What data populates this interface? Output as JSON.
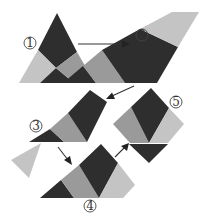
{
  "diagram": {
    "colors": {
      "dark": "#2e2e2e",
      "mid": "#9a9a9a",
      "light": "#c4c4c4",
      "background": "#ffffff"
    },
    "steps": [
      {
        "id": 1,
        "label": "①",
        "description": "Equilateral triangle divided into pieces"
      },
      {
        "id": 2,
        "label": "②",
        "description": "Pieces rearranged into slanted strip"
      },
      {
        "id": 3,
        "label": "③",
        "description": "Strip cut and shifted"
      },
      {
        "id": 4,
        "label": "④",
        "description": "Pieces rotated into trapezoid"
      },
      {
        "id": 5,
        "label": "⑤",
        "description": "Pieces form a square"
      }
    ],
    "arrows": [
      {
        "from": 1,
        "to": 2
      },
      {
        "from": 2,
        "to": 3
      },
      {
        "from": 3,
        "to": 4
      },
      {
        "from": 4,
        "to": 5
      }
    ]
  }
}
